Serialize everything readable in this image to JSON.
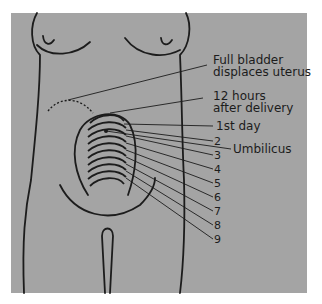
{
  "figure": {
    "background_color": "#a4a4a4",
    "line_color": "#1c1c1c",
    "labels": {
      "full_bladder_line1": "Full bladder",
      "full_bladder_line2": "displaces uterus",
      "twelve_hours_line1": "12 hours",
      "twelve_hours_line2": "after delivery",
      "first_day": "1st day",
      "umbilicus": "Umbilicus"
    },
    "day_numbers": [
      "2",
      "3",
      "4",
      "5",
      "6",
      "7",
      "8",
      "9"
    ]
  }
}
